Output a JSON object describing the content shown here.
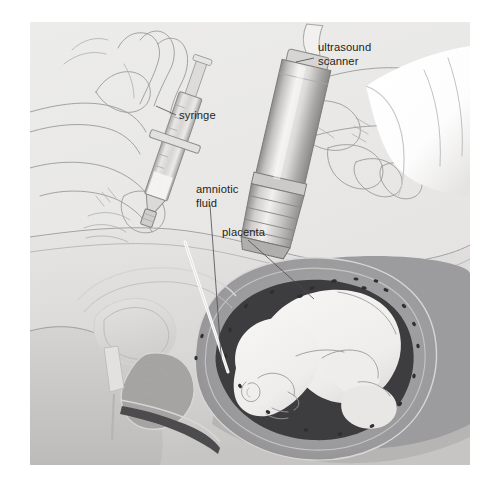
{
  "figure": {
    "kind": "medical-illustration",
    "page_background": "#ffffff",
    "canvas": {
      "x": 30,
      "y": 22,
      "width": 440,
      "height": 443,
      "background": "#e9e8e6"
    }
  },
  "labels": [
    {
      "id": "ultrasound-scanner",
      "line1": "ultrasound",
      "line2": "scanner",
      "text_x": 318,
      "text_y": 51,
      "leader": "M 314 58 L 296 62"
    },
    {
      "id": "syringe",
      "line1": "syringe",
      "line2": "",
      "text_x": 179,
      "text_y": 119,
      "leader": "M 176 115 L 156 106"
    },
    {
      "id": "amniotic-fluid",
      "line1": "amniotic",
      "line2": "fluid",
      "text_x": 196,
      "text_y": 193,
      "leader": "M 210 205 L 222 368"
    },
    {
      "id": "placenta",
      "line1": "placenta",
      "line2": "",
      "text_x": 222,
      "text_y": 236,
      "leader": "M 248 240 L 314 299"
    }
  ],
  "palette": {
    "canvas_bg": "#e9e8e6",
    "skin_light": "#e3e2e0",
    "skin_mid": "#d2d1cf",
    "skin_shadow": "#bdbcba",
    "body_tone": "#cfcecc",
    "uterus_wall": "#9c9c9e",
    "placenta_gray": "#8e8e90",
    "amniotic_dark": "#3d3d3f",
    "fetus_light": "#f2f1ef",
    "needle_white": "#fbfbfa",
    "probe_light": "#e6e5e3",
    "probe_mid": "#c9c8c6",
    "probe_dark": "#9b9a98",
    "sleeve_white": "#ffffff",
    "label_ink": "#231f20",
    "leader_ink": "#4a4a4a",
    "lineart_ink": "#9a9a9e",
    "speckle": "#2f2f31"
  },
  "anatomy": {
    "parts": [
      "maternal abdomen",
      "uterine wall",
      "placenta",
      "amniotic cavity",
      "fetus",
      "urinary bladder",
      "pubic bone",
      "cervix",
      "vagina",
      "rectum"
    ]
  },
  "instruments": {
    "syringe": {
      "name": "syringe",
      "held_by": "left hand",
      "parts": [
        "plunger",
        "barrel",
        "finger flange",
        "hub",
        "needle"
      ]
    },
    "scanner": {
      "name": "ultrasound scanner",
      "held_by": "right hand",
      "parts": [
        "cable",
        "probe body",
        "ribbed grip",
        "transducer face"
      ]
    }
  }
}
